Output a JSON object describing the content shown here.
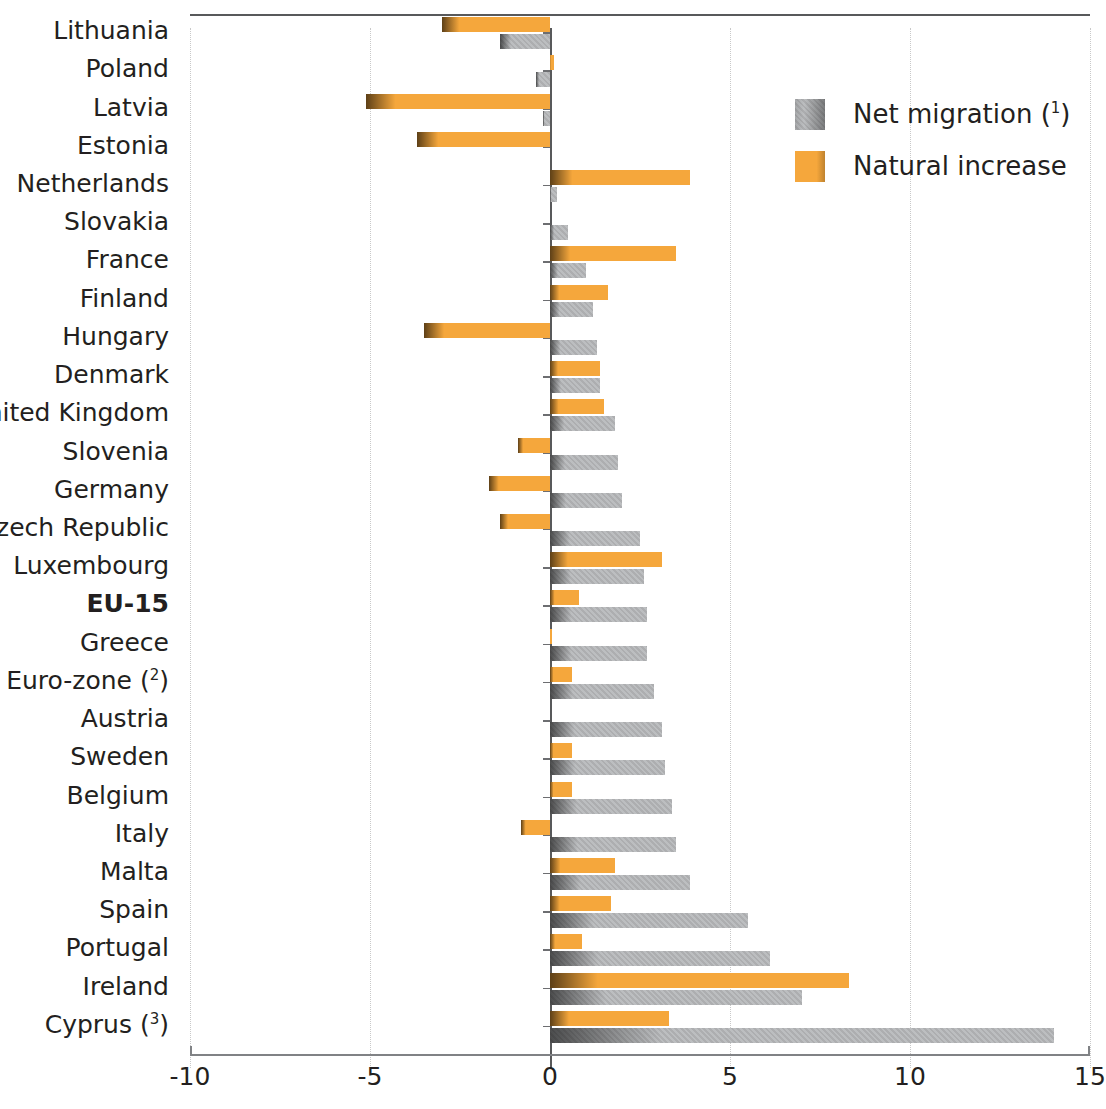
{
  "chart_data": {
    "type": "bar",
    "orientation": "horizontal",
    "title": "",
    "subtitle": "",
    "xlabel": "",
    "ylabel": "",
    "xlim": [
      -10,
      15
    ],
    "xticks": [
      -10,
      -5,
      0,
      5,
      10,
      15
    ],
    "xtick_labels": [
      "-10",
      "-5",
      "0",
      "5",
      "10",
      "15"
    ],
    "grid": "vertical-dotted",
    "legend_position": "top-right",
    "legend": [
      {
        "name": "Net migration",
        "note": "1",
        "color": "#b0b2b4"
      },
      {
        "name": "Natural increase",
        "note": "",
        "color": "#f5a73c"
      }
    ],
    "categories": [
      "Lithuania",
      "Poland",
      "Latvia",
      "Estonia",
      "Netherlands",
      "Slovakia",
      "France",
      "Finland",
      "Hungary",
      "Denmark",
      "United Kingdom",
      "Slovenia",
      "Germany",
      "Czech Republic",
      "Luxembourg",
      "EU-15",
      "Greece",
      "Euro-zone",
      "Austria",
      "Sweden",
      "Belgium",
      "Italy",
      "Malta",
      "Spain",
      "Portugal",
      "Ireland",
      "Cyprus"
    ],
    "category_notes": {
      "Euro-zone": "2",
      "Cyprus": "3"
    },
    "bold_categories": [
      "EU-15"
    ],
    "series": [
      {
        "name": "Natural increase",
        "color": "#f5a73c",
        "values": [
          -3.0,
          0.1,
          -5.1,
          -3.7,
          3.9,
          0.0,
          3.5,
          1.6,
          -3.5,
          1.4,
          1.5,
          -0.9,
          -1.7,
          -1.4,
          3.1,
          0.8,
          0.05,
          0.6,
          0.0,
          0.6,
          0.6,
          -0.8,
          1.8,
          1.7,
          0.9,
          8.3,
          3.3
        ]
      },
      {
        "name": "Net migration",
        "color": "#b0b2b4",
        "values": [
          -1.4,
          -0.4,
          -0.2,
          0.0,
          0.2,
          0.5,
          1.0,
          1.2,
          1.3,
          1.4,
          1.8,
          1.9,
          2.0,
          2.5,
          2.6,
          2.7,
          2.7,
          2.9,
          3.1,
          3.2,
          3.4,
          3.5,
          3.9,
          5.5,
          6.1,
          7.0,
          14.0
        ]
      }
    ]
  },
  "footnote_markers": {
    "net_migration": "1",
    "euro_zone": "2",
    "cyprus": "3"
  }
}
